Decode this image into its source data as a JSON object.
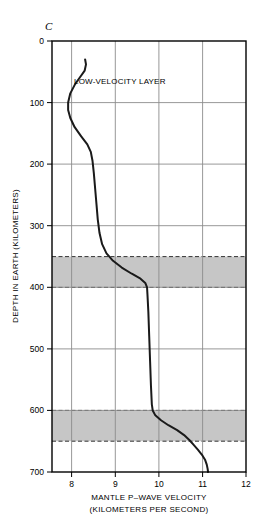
{
  "figure": {
    "panel_label": "C",
    "annotation": "LOW-VELOCITY LAYER"
  },
  "colors": {
    "curve": "#1a1a1a",
    "grid": "#8c8c8c",
    "frame": "#000000",
    "band_fill": "#c6c6c6",
    "band_edge": "#333333",
    "background": "#ffffff"
  },
  "chart_data": {
    "type": "line",
    "title": "",
    "xlabel_line1": "MANTLE  P–WAVE VELOCITY",
    "xlabel_line2": "(KILOMETERS PER SECOND)",
    "ylabel": "DEPTH IN EARTH (KILOMETERS)",
    "xlim": [
      7.55,
      12.0
    ],
    "ylim": [
      0,
      700
    ],
    "y_inverted": true,
    "grid": true,
    "legend": "none",
    "xticks": [
      8,
      9,
      10,
      11,
      12
    ],
    "xtick_labels": [
      "8",
      "9",
      "10",
      "11",
      "12"
    ],
    "yticks": [
      0,
      100,
      200,
      300,
      400,
      500,
      600,
      700
    ],
    "ytick_labels": [
      "0",
      "100",
      "200",
      "300",
      "400",
      "500",
      "600",
      "700"
    ],
    "series": [
      {
        "name": "P-wave velocity profile",
        "x_unit": "km/s",
        "y_unit": "km",
        "points": [
          [
            8.31,
            30
          ],
          [
            8.33,
            38
          ],
          [
            8.3,
            48
          ],
          [
            8.2,
            58
          ],
          [
            8.08,
            70
          ],
          [
            7.97,
            85
          ],
          [
            7.92,
            100
          ],
          [
            7.92,
            112
          ],
          [
            7.97,
            125
          ],
          [
            8.07,
            140
          ],
          [
            8.22,
            155
          ],
          [
            8.36,
            168
          ],
          [
            8.44,
            180
          ],
          [
            8.48,
            195
          ],
          [
            8.51,
            215
          ],
          [
            8.54,
            240
          ],
          [
            8.57,
            265
          ],
          [
            8.6,
            290
          ],
          [
            8.64,
            312
          ],
          [
            8.7,
            330
          ],
          [
            8.8,
            345
          ],
          [
            8.95,
            357
          ],
          [
            9.15,
            368
          ],
          [
            9.38,
            378
          ],
          [
            9.58,
            386
          ],
          [
            9.69,
            393
          ],
          [
            9.73,
            400
          ],
          [
            9.74,
            412
          ],
          [
            9.76,
            440
          ],
          [
            9.78,
            480
          ],
          [
            9.8,
            520
          ],
          [
            9.82,
            560
          ],
          [
            9.84,
            590
          ],
          [
            9.86,
            600
          ],
          [
            9.92,
            608
          ],
          [
            10.05,
            616
          ],
          [
            10.22,
            624
          ],
          [
            10.42,
            632
          ],
          [
            10.58,
            640
          ],
          [
            10.7,
            648
          ],
          [
            10.8,
            656
          ],
          [
            10.9,
            664
          ],
          [
            10.99,
            672
          ],
          [
            11.06,
            680
          ],
          [
            11.1,
            688
          ],
          [
            11.12,
            695
          ],
          [
            11.13,
            700
          ]
        ]
      }
    ],
    "shaded_bands": [
      {
        "name": "transition-zone-upper",
        "depth_top": 350,
        "depth_bottom": 400
      },
      {
        "name": "transition-zone-lower",
        "depth_top": 600,
        "depth_bottom": 650
      }
    ]
  }
}
